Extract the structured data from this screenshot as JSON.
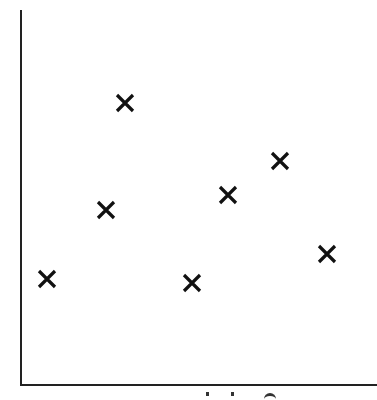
{
  "chart_data": {
    "type": "scatter",
    "title": "",
    "xlabel": "",
    "ylabel": "",
    "marker": "x",
    "grid": false,
    "legend": null,
    "ticks": {
      "x": [],
      "y": []
    },
    "axis_note": "No tick labels or numeric scale visible; x-axis label text is clipped at the bottom edge and unreadable.",
    "pixel_frame": {
      "x_axis_y": 385,
      "y_axis_x": 21,
      "y_axis_top": 10,
      "x_axis_right": 377
    },
    "points": [
      {
        "px": 47,
        "py": 279
      },
      {
        "px": 106,
        "py": 210
      },
      {
        "px": 125,
        "py": 103
      },
      {
        "px": 192,
        "py": 283
      },
      {
        "px": 228,
        "py": 195
      },
      {
        "px": 280,
        "py": 161
      },
      {
        "px": 327,
        "py": 254
      }
    ],
    "points_normalized_0_100": [
      {
        "x": 7,
        "y": 28
      },
      {
        "x": 24,
        "y": 47
      },
      {
        "x": 29,
        "y": 75
      },
      {
        "x": 48,
        "y": 27
      },
      {
        "x": 58,
        "y": 51
      },
      {
        "x": 73,
        "y": 60
      },
      {
        "x": 86,
        "y": 35
      }
    ],
    "colors": {
      "axis": "#222222",
      "marker": "#111111",
      "background": "#ffffff"
    }
  }
}
